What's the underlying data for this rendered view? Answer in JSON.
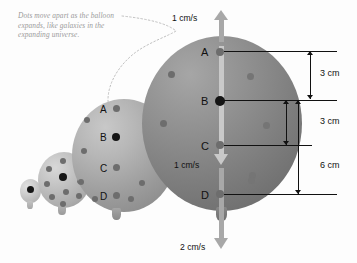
{
  "figure": {
    "caption": "Dots move apart as the balloon expands, like galaxies in the expanding universe.",
    "background_color": "#fdfdfd"
  },
  "colors": {
    "balloon_large": "#7e7e7e",
    "balloon_medium": "#9c9c9c",
    "balloon_small": "#b4b4b4",
    "balloon_tiny": "#c8c8c8",
    "dot_gray": "#6d6d6d",
    "dot_black": "#151515",
    "arrow_gray": "#a8a8a8",
    "caption_text": "#9a9a9a",
    "line_black": "#111111"
  },
  "balloons": [
    {
      "name": "tiny",
      "label": ""
    },
    {
      "name": "small",
      "label": ""
    },
    {
      "name": "medium",
      "label": ""
    },
    {
      "name": "large",
      "label": ""
    }
  ],
  "points_medium": [
    {
      "label": "A",
      "style": "gray"
    },
    {
      "label": "B",
      "style": "black"
    },
    {
      "label": "C",
      "style": "gray"
    },
    {
      "label": "D",
      "style": "gray"
    }
  ],
  "points_large": [
    {
      "label": "A",
      "style": "gray"
    },
    {
      "label": "B",
      "style": "black"
    },
    {
      "label": "C",
      "style": "gray"
    },
    {
      "label": "D",
      "style": "gray"
    }
  ],
  "velocities": {
    "top": "1 cm/s",
    "middle": "1 cm/s",
    "bottom": "2 cm/s"
  },
  "dimensions": [
    {
      "label": "3 cm",
      "from": "A",
      "to": "B"
    },
    {
      "label": "3 cm",
      "from": "B",
      "to": "C"
    },
    {
      "label": "6 cm",
      "from": "B",
      "to": "D"
    }
  ]
}
